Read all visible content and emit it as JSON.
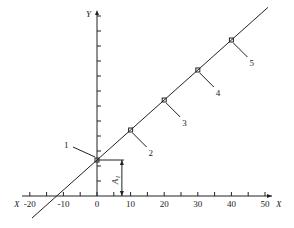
{
  "figure": {
    "x_axis": {
      "label": "X",
      "ticks": [
        -20,
        -10,
        0,
        10,
        20,
        30,
        40,
        50
      ],
      "tick_labels": [
        "-20",
        "-10",
        "0",
        "10",
        "20",
        "30",
        "40",
        "50"
      ],
      "minor_step": 5
    },
    "y_axis": {
      "label": "Y",
      "tick_count": 12
    },
    "points": [
      {
        "label": "1",
        "x": 0
      },
      {
        "label": "2",
        "x": 10
      },
      {
        "label": "3",
        "x": 20
      },
      {
        "label": "4",
        "x": 30
      },
      {
        "label": "5",
        "x": 40
      }
    ],
    "offset_label": "A₁",
    "colors": {
      "ink": "#222222",
      "background": "#ffffff"
    }
  }
}
